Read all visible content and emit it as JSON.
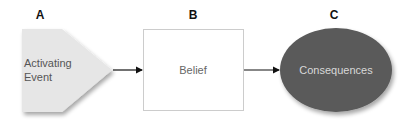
{
  "diagram": {
    "type": "ABC model flow",
    "nodes": [
      {
        "id": "A",
        "label": "A",
        "text_line1": "Activating",
        "text_line2": "Event",
        "shape": "pentagon-arrow",
        "fill": "#e6e6e6",
        "text_color": "#555555"
      },
      {
        "id": "B",
        "label": "B",
        "text": "Belief",
        "shape": "rectangle",
        "fill": "#ffffff",
        "stroke": "#cccccc",
        "text_color": "#666666"
      },
      {
        "id": "C",
        "label": "C",
        "text": "Consequences",
        "shape": "ellipse",
        "fill": "#5a5a5a",
        "text_color": "#d8d8d8"
      }
    ],
    "edges": [
      {
        "from": "A",
        "to": "B"
      },
      {
        "from": "B",
        "to": "C"
      }
    ]
  }
}
